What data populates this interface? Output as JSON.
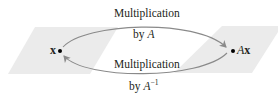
{
  "diagram": {
    "left_space": {
      "vector_label": "x",
      "fill": "#ebebeb"
    },
    "right_space": {
      "vector_label_prefix": "A",
      "vector_label_suffix": "x",
      "fill": "#ebebeb"
    },
    "top_arrow": {
      "line1": "Multiplication",
      "line2_prefix": "by ",
      "line2_matrix": "A",
      "direction": "x → Ax"
    },
    "bottom_arrow": {
      "line1": "Multiplication",
      "line2_prefix": "by ",
      "line2_matrix": "A",
      "line2_superscript": "−1",
      "direction": "Ax → x"
    },
    "colors": {
      "arrow": "#8a8a8a",
      "text": "#231f20",
      "point": "#000000"
    }
  }
}
